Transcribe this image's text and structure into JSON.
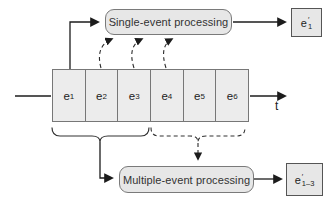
{
  "diagram": {
    "single_box": {
      "label": "Single-event processing"
    },
    "multi_box": {
      "label": "Multiple-event processing"
    },
    "output_top": {
      "base": "e",
      "sup": "′",
      "sub": "1"
    },
    "output_bottom": {
      "base": "e",
      "sup": "′",
      "sub": "1–3"
    },
    "timeline": {
      "axis_label": "t",
      "events": [
        {
          "base": "e",
          "sub": "1"
        },
        {
          "base": "e",
          "sub": "2"
        },
        {
          "base": "e",
          "sub": "3"
        },
        {
          "base": "e",
          "sub": "4"
        },
        {
          "base": "e",
          "sub": "5"
        },
        {
          "base": "e",
          "sub": "6"
        }
      ]
    },
    "colors": {
      "box_fill": "#e7e7e7",
      "box_border": "#7a7a7a",
      "line": "#1c1c1c"
    }
  }
}
